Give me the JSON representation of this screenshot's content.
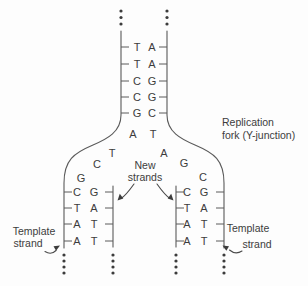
{
  "diagram": {
    "parent_duplex": {
      "pairs": [
        [
          "T",
          "A"
        ],
        [
          "T",
          "A"
        ],
        [
          "C",
          "G"
        ],
        [
          "C",
          "G"
        ],
        [
          "G",
          "C"
        ]
      ],
      "fork_pair": [
        "A",
        "T"
      ]
    },
    "left_branch": {
      "unpaired_bases": [
        "T",
        "C",
        "G"
      ],
      "pairs": [
        [
          "C",
          "G"
        ],
        [
          "T",
          "A"
        ],
        [
          "A",
          "T"
        ],
        [
          "A",
          "T"
        ]
      ]
    },
    "right_branch": {
      "unpaired_bases": [
        "A",
        "G",
        "C"
      ],
      "pairs": [
        [
          "C",
          "G"
        ],
        [
          "T",
          "A"
        ],
        [
          "A",
          "T"
        ],
        [
          "A",
          "T"
        ]
      ]
    },
    "labels": {
      "replication_fork_line1": "Replication",
      "replication_fork_line2": "fork (Y-junction)",
      "new_strands_line1": "New",
      "new_strands_line2": "strands",
      "template_left_line1": "Template",
      "template_left_line2": "strand",
      "template_right_line1": "Template",
      "template_right_line2": "strand"
    },
    "colors": {
      "stroke": "#5a5a5a",
      "text": "#3c3c3c",
      "background": "#fdfdfd"
    }
  }
}
